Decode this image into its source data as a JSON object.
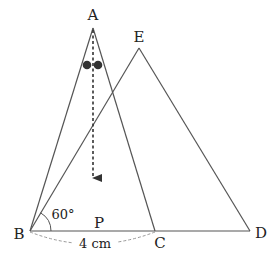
{
  "diagram": {
    "type": "geometry",
    "points": {
      "A": {
        "label": "A",
        "x": 93,
        "y": 28,
        "label_x": 93,
        "label_y": 15
      },
      "E": {
        "label": "E",
        "x": 139,
        "y": 48,
        "label_x": 139,
        "label_y": 37
      },
      "B": {
        "label": "B",
        "x": 30,
        "y": 231,
        "label_x": 19,
        "label_y": 234
      },
      "C": {
        "label": "C",
        "x": 155,
        "y": 231,
        "label_x": 160,
        "label_y": 242
      },
      "D": {
        "label": "D",
        "x": 250,
        "y": 231,
        "label_x": 261,
        "label_y": 233
      },
      "P": {
        "label": "P",
        "x": 99,
        "y": 224,
        "label_x": 99,
        "label_y": 223
      }
    },
    "angle_label": "60°",
    "angle_vertex": "B",
    "length_label": "4 cm",
    "length_between": [
      "B",
      "C"
    ],
    "triangles": [
      [
        "A",
        "B",
        "C"
      ],
      [
        "E",
        "B",
        "D"
      ]
    ],
    "dots": [
      {
        "x": 87,
        "y": 65,
        "r": 4
      },
      {
        "x": 98,
        "y": 65,
        "r": 4
      }
    ],
    "arrow": {
      "from": "A",
      "to_y": 178,
      "style": "dashed"
    },
    "colors": {
      "line": "#555555",
      "dashed": "#999999",
      "text": "#222222",
      "dot": "#333333"
    }
  }
}
